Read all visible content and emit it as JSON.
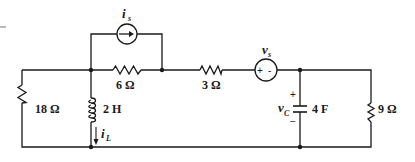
{
  "diagram": {
    "type": "circuit",
    "components": {
      "current_source": {
        "symbol": "i",
        "subscript": "s"
      },
      "voltage_source": {
        "symbol": "v",
        "subscript": "s",
        "polarity": "+ -"
      },
      "r_left": {
        "label": "18 Ω"
      },
      "r_top": {
        "label": "6 Ω"
      },
      "r_mid": {
        "label": "3 Ω"
      },
      "r_right": {
        "label": "9 Ω"
      },
      "inductor": {
        "label": "2 H",
        "current_symbol": "i",
        "current_subscript": "L"
      },
      "capacitor": {
        "label": "4 F",
        "voltage_symbol": "v",
        "voltage_subscript": "C",
        "plus": "+",
        "minus": "−"
      }
    },
    "stroke_color": "#1a1a1a",
    "background": "#ffffff"
  }
}
